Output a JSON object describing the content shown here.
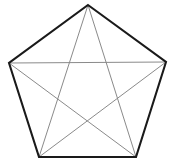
{
  "figure": {
    "shape_type": "pentagon",
    "background_color": "#ffffff",
    "canvas": {
      "width": 174,
      "height": 167
    },
    "outline": {
      "name": "pentagon-outline",
      "color": "#1a1a1a",
      "stroke_width": 2.1,
      "closed": true,
      "points": "88,5 166,62 136,157 39,157 9,63"
    },
    "vertices": [
      {
        "label": "A",
        "role": "apex-top",
        "x": 88,
        "y": 5
      },
      {
        "label": "B",
        "role": "upper-right",
        "x": 166,
        "y": 62
      },
      {
        "label": "C",
        "role": "lower-right",
        "x": 136,
        "y": 157
      },
      {
        "label": "D",
        "role": "lower-left",
        "x": 39,
        "y": 157
      },
      {
        "label": "E",
        "role": "upper-left",
        "x": 9,
        "y": 63
      }
    ],
    "diagonals": {
      "color": "#8a8a8a",
      "stroke_width": 1.0,
      "count": 5,
      "segments": [
        {
          "name": "diagonal-apex-to-lower-right",
          "from": "A",
          "to": "C",
          "x1": 88,
          "y1": 5,
          "x2": 136,
          "y2": 157
        },
        {
          "name": "diagonal-apex-to-lower-left",
          "from": "A",
          "to": "D",
          "x1": 88,
          "y1": 5,
          "x2": 39,
          "y2": 157
        },
        {
          "name": "diagonal-upper-right-to-lower-left",
          "from": "B",
          "to": "D",
          "x1": 166,
          "y1": 62,
          "x2": 39,
          "y2": 157
        },
        {
          "name": "diagonal-upper-left-to-lower-right",
          "from": "E",
          "to": "C",
          "x1": 9,
          "y1": 63,
          "x2": 136,
          "y2": 157
        },
        {
          "name": "diagonal-upper-left-to-upper-right",
          "from": "E",
          "to": "B",
          "x1": 9,
          "y1": 63,
          "x2": 166,
          "y2": 62
        }
      ]
    },
    "edges": [
      {
        "name": "edge-apex-to-upper-right",
        "from": "A",
        "to": "B"
      },
      {
        "name": "edge-upper-right-to-lower-right",
        "from": "B",
        "to": "C"
      },
      {
        "name": "edge-lower-right-to-lower-left",
        "from": "C",
        "to": "D"
      },
      {
        "name": "edge-lower-left-to-upper-left",
        "from": "D",
        "to": "E"
      },
      {
        "name": "edge-upper-left-to-apex",
        "from": "E",
        "to": "A"
      }
    ]
  }
}
